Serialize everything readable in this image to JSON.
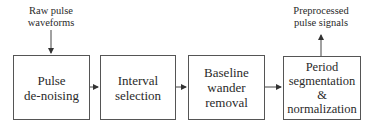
{
  "diagram": {
    "input_label": [
      "Raw pulse",
      "waveforms"
    ],
    "output_label": [
      "Preprocessed",
      "pulse signals"
    ],
    "blocks": [
      {
        "lines": [
          "Pulse",
          "de-noising"
        ]
      },
      {
        "lines": [
          "Interval",
          "selection"
        ]
      },
      {
        "lines": [
          "Baseline",
          "wander",
          "removal"
        ]
      },
      {
        "lines": [
          "Period",
          "segmentation",
          "&",
          "normalization"
        ]
      }
    ],
    "colors": {
      "stroke": "#555555",
      "text": "#2a2a2a",
      "background": "#ffffff"
    }
  }
}
